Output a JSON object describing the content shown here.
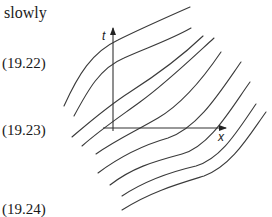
{
  "page_text": {
    "fragment_word": "slowly",
    "equation_numbers": [
      "(19.22)",
      "(19.23)",
      "(19.24)"
    ]
  },
  "figure": {
    "type": "diagram",
    "axes": {
      "vertical_label": "t",
      "horizontal_label": "x"
    },
    "curve_count": 9,
    "line_color": "#3a3a3a",
    "axis_color": "#333333"
  }
}
